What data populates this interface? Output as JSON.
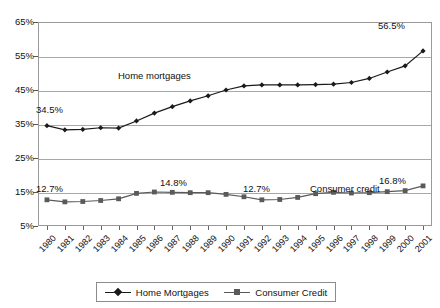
{
  "chart_data": {
    "type": "line",
    "title": "",
    "xlabel": "",
    "ylabel": "",
    "ylim": [
      5,
      65
    ],
    "ytick_values": [
      65,
      55,
      45,
      35,
      25,
      15,
      5
    ],
    "ytick_labels": [
      "65%",
      "55%",
      "45%",
      "35%",
      "25%",
      "15%",
      "5%"
    ],
    "grid": true,
    "legend_position": "bottom",
    "categories": [
      "1980",
      "1981",
      "1982",
      "1983",
      "1984",
      "1985",
      "1986",
      "1987",
      "1988",
      "1989",
      "1990",
      "1991",
      "1992",
      "1993",
      "1994",
      "1995",
      "1996",
      "1997",
      "1998",
      "1999",
      "2000",
      "2001"
    ],
    "series": [
      {
        "name": "Home Mortgages",
        "marker": "diamond",
        "color": "#1a1a1a",
        "values": [
          34.5,
          33.3,
          33.4,
          33.9,
          33.8,
          35.9,
          38.2,
          40.1,
          41.8,
          43.3,
          45.0,
          46.2,
          46.5,
          46.5,
          46.5,
          46.6,
          46.7,
          47.2,
          48.4,
          50.3,
          52.1,
          56.5
        ]
      },
      {
        "name": "Consumer Credit",
        "marker": "square",
        "color": "#5a5a5a",
        "values": [
          12.7,
          12.1,
          12.2,
          12.5,
          13.0,
          14.6,
          15.0,
          14.9,
          14.8,
          14.8,
          14.3,
          13.6,
          12.7,
          12.8,
          13.4,
          14.5,
          14.9,
          14.7,
          14.8,
          15.1,
          15.4,
          16.8
        ]
      }
    ],
    "annotations": [
      {
        "id": "home-mortgages-label",
        "text": "Home mortgages",
        "x_px": 118,
        "y_px": 70
      },
      {
        "id": "consumer-credit-label",
        "text": "Consumer credit",
        "x_px": 310,
        "y_px": 183
      },
      {
        "id": "callout-1980-mortgage",
        "text": "34.5%",
        "x_px": 36,
        "y_px": 104
      },
      {
        "id": "callout-2001-mortgage",
        "text": "56.5%",
        "x_px": 378,
        "y_px": 20
      },
      {
        "id": "callout-1980-credit",
        "text": "12.7%",
        "x_px": 36,
        "y_px": 183
      },
      {
        "id": "callout-1986-credit",
        "text": "14.8%",
        "x_px": 160,
        "y_px": 177
      },
      {
        "id": "callout-1992-credit",
        "text": "12.7%",
        "x_px": 243,
        "y_px": 183
      },
      {
        "id": "callout-2001-credit",
        "text": "16.8%",
        "x_px": 379,
        "y_px": 175
      }
    ]
  },
  "legend": {
    "entries": [
      {
        "label": "Home Mortgages",
        "marker": "diamond",
        "color": "#1a1a1a"
      },
      {
        "label": "Consumer Credit",
        "marker": "square",
        "color": "#5a5a5a"
      }
    ]
  },
  "colors": {
    "home_mortgages": "#1a1a1a",
    "consumer_credit": "#5a5a5a",
    "gridline": "#a8a8a8",
    "frame": "#9a9a9a",
    "text": "#111111",
    "background": "#ffffff"
  }
}
